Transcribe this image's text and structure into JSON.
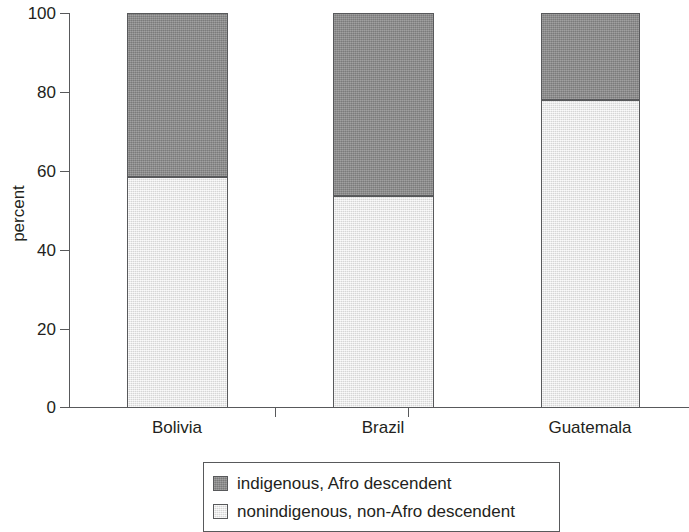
{
  "chart_data": {
    "type": "bar",
    "subtype": "stacked-bar-100",
    "title": "",
    "xlabel": "",
    "ylabel": "percent",
    "categories": [
      "Bolivia",
      "Brazil",
      "Guatemala"
    ],
    "ylim": [
      0,
      100
    ],
    "yticks": [
      0,
      20,
      40,
      60,
      80,
      100
    ],
    "ytick_labels": [
      "0",
      "20",
      "40",
      "60",
      "80",
      "100"
    ],
    "grid": false,
    "legend_position": "bottom",
    "series": [
      {
        "name": "nonindigenous, non-Afro descendent",
        "color": "#e9e9e9",
        "values": [
          58.6,
          53.6,
          77.9
        ]
      },
      {
        "name": "indigenous, Afro descendent",
        "color": "#8c8c8c",
        "values": [
          41.4,
          46.4,
          22.1
        ]
      }
    ]
  },
  "axes": {
    "y_title": "percent",
    "y_ticks": [
      {
        "label": "100",
        "value": 100
      },
      {
        "label": "80",
        "value": 80
      },
      {
        "label": "60",
        "value": 60
      },
      {
        "label": "40",
        "value": 40
      },
      {
        "label": "20",
        "value": 20
      },
      {
        "label": "0",
        "value": 0
      }
    ],
    "x_categories": [
      {
        "label": "Bolivia"
      },
      {
        "label": "Brazil"
      },
      {
        "label": "Guatemala"
      }
    ]
  },
  "legend": {
    "items": [
      {
        "label": "indigenous, Afro descendent",
        "color": "#8c8c8c"
      },
      {
        "label": "nonindigenous, non-Afro descendent",
        "color": "#e9e9e9"
      }
    ]
  },
  "colors": {
    "dark_segment": "#8c8c8c",
    "light_segment": "#e9e9e9",
    "axis": "#58595b",
    "text": "#231f20",
    "background": "#ffffff"
  }
}
